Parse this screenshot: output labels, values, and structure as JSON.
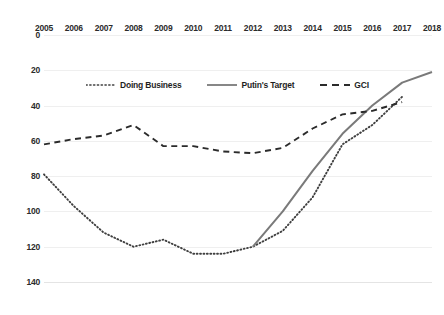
{
  "chart_data": {
    "type": "line",
    "title": "",
    "xlabel": "",
    "ylabel": "",
    "x": [
      2005,
      2006,
      2007,
      2008,
      2009,
      2010,
      2011,
      2012,
      2013,
      2014,
      2015,
      2016,
      2017,
      2018
    ],
    "categories": [
      "2005",
      "2006",
      "2007",
      "2008",
      "2009",
      "2010",
      "2011",
      "2012",
      "2013",
      "2014",
      "2015",
      "2016",
      "2017",
      "2018"
    ],
    "xlim": [
      2005,
      2018
    ],
    "ylim": [
      0,
      140
    ],
    "y_inverted": true,
    "y_ticks": [
      0,
      20,
      40,
      60,
      80,
      100,
      120,
      140
    ],
    "grid": true,
    "legend_position": "inside-top-left",
    "series": [
      {
        "name": "Doing Business",
        "style": "dotted",
        "color": "#3f3f3f",
        "x": [
          2005,
          2006,
          2007,
          2008,
          2009,
          2010,
          2011,
          2012,
          2013,
          2014,
          2015,
          2016,
          2017
        ],
        "values": [
          79,
          97,
          112,
          120,
          116,
          124,
          124,
          120,
          111,
          92,
          62,
          51,
          35
        ]
      },
      {
        "name": "Putin's Target",
        "style": "solid",
        "color": "#7a7a7a",
        "x": [
          2012,
          2013,
          2014,
          2015,
          2016,
          2017,
          2018
        ],
        "values": [
          120,
          100,
          77,
          56,
          40,
          27,
          21
        ]
      },
      {
        "name": "GCI",
        "style": "dashed",
        "color": "#2b2b2b",
        "x": [
          2005,
          2006,
          2007,
          2008,
          2009,
          2010,
          2011,
          2012,
          2013,
          2014,
          2015,
          2016,
          2017
        ],
        "values": [
          62,
          59,
          57,
          51,
          63,
          63,
          66,
          67,
          64,
          53,
          45,
          43,
          38
        ]
      }
    ]
  },
  "legend": {
    "items": [
      {
        "label": "Doing Business"
      },
      {
        "label": "Putin's Target"
      },
      {
        "label": "GCI"
      }
    ]
  }
}
